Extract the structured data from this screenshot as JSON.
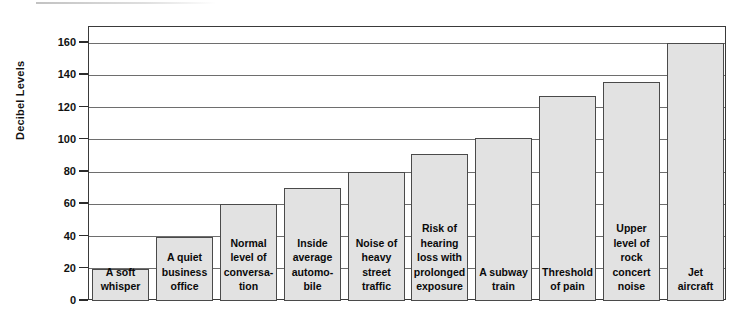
{
  "chart_data": {
    "type": "bar",
    "title": "",
    "xlabel": "",
    "ylabel": "Decibel Levels",
    "ylim": [
      0,
      170
    ],
    "ytick_values": [
      0,
      20,
      40,
      60,
      80,
      100,
      120,
      140,
      160
    ],
    "ytick_labels": [
      "0",
      "20",
      "40",
      "60",
      "80",
      "100",
      "120",
      "140",
      "160"
    ],
    "grid": true,
    "legend": "none",
    "bar_fill_color": "#e2e2e2",
    "bar_border_color": "#4a4a4a",
    "gridline_color": "#6e6e6e",
    "axis_color": "#3a3a3a",
    "categories": [
      "A soft whisper",
      "A quiet business office",
      "Normal level of conversa-tion",
      "Inside average automo-bile",
      "Noise of heavy street traffic",
      "Risk of hearing loss with prolonged exposure",
      "A subway train",
      "Threshold of pain",
      "Upper level of rock concert noise",
      "Jet aircraft"
    ],
    "values": [
      20,
      40,
      60,
      70,
      80,
      91,
      101,
      127,
      136,
      160
    ],
    "bars": [
      {
        "label": "A soft whisper",
        "value": 20
      },
      {
        "label": "A quiet business office",
        "value": 40
      },
      {
        "label": "Normal level of conversa-tion",
        "value": 60
      },
      {
        "label": "Inside average automo-bile",
        "value": 70
      },
      {
        "label": "Noise of heavy street traffic",
        "value": 80
      },
      {
        "label": "Risk of hearing loss with prolonged exposure",
        "value": 91
      },
      {
        "label": "A subway train",
        "value": 101
      },
      {
        "label": "Threshold of pain",
        "value": 127
      },
      {
        "label": "Upper level of rock concert noise",
        "value": 136
      },
      {
        "label": "Jet aircraft",
        "value": 160
      }
    ]
  }
}
